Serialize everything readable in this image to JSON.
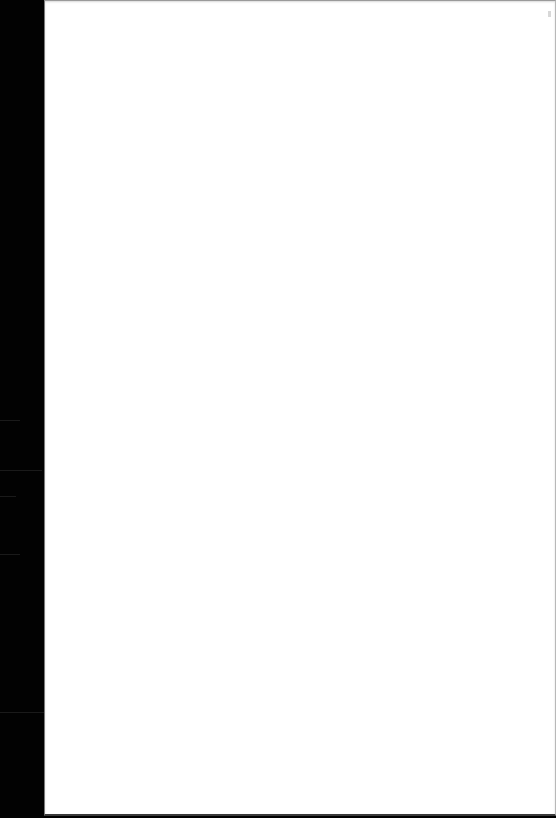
{
  "document": {
    "page_content": "",
    "colors": {
      "page": "#ffffff",
      "margin": "#000000"
    }
  }
}
